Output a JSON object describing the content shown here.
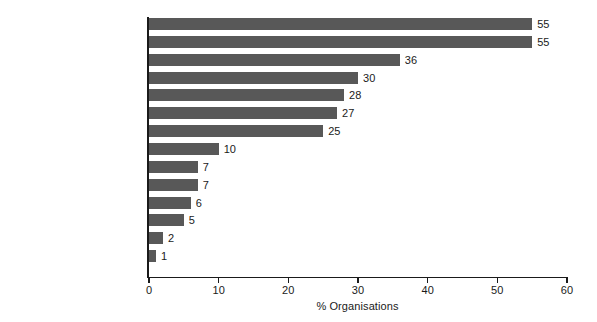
{
  "chart_data": {
    "type": "bar",
    "orientation": "horizontal",
    "title": "",
    "xlabel": "% Organisations",
    "ylabel": "",
    "xlim": [
      0,
      60
    ],
    "xticks": [
      0,
      10,
      20,
      30,
      40,
      50,
      60
    ],
    "xtick_labels": [
      "0",
      "10",
      "20",
      "30",
      "40",
      "50",
      "60"
    ],
    "grid": false,
    "legend": null,
    "bar_color": "#585858",
    "axis_color": "#1a1a1a",
    "background_color": "#ffffff",
    "categories": [
      "Economic issues",
      "Development",
      "Democracy building",
      "Environment",
      "Labour, trade unions",
      "Human rights",
      "Peace and conflict resolution",
      "Student, youth",
      "Humanitarian assistance",
      "Migration, refugees",
      "Gender issues",
      "Others",
      "Religion",
      "Gay/lesbian"
    ],
    "values": [
      55,
      55,
      36,
      30,
      28,
      27,
      25,
      10,
      7,
      7,
      6,
      5,
      2,
      1
    ],
    "value_labels": [
      "55",
      "55",
      "36",
      "30",
      "28",
      "27",
      "25",
      "10",
      "7",
      "7",
      "6",
      "5",
      "2",
      "1"
    ]
  }
}
